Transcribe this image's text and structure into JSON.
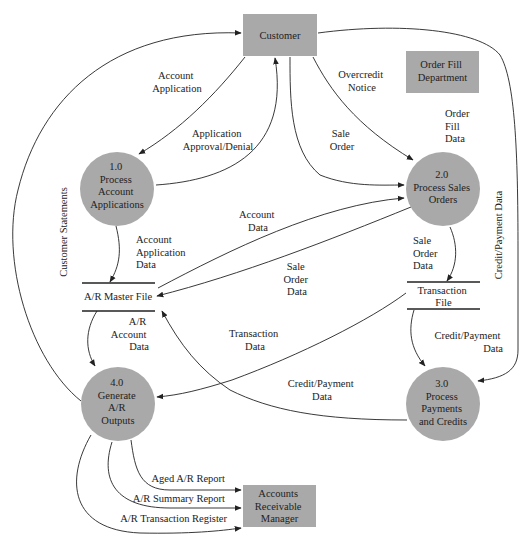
{
  "diagram": {
    "type": "data-flow-diagram",
    "colors": {
      "shape_fill": "#a9a9a9",
      "line": "#222222",
      "text": "#222222",
      "background": "#ffffff"
    },
    "external_entities": [
      {
        "id": "customer",
        "lines": [
          "Customer"
        ]
      },
      {
        "id": "order_fill",
        "lines": [
          "Order Fill",
          "Department"
        ]
      },
      {
        "id": "ar_manager",
        "lines": [
          "Accounts",
          "Receivable",
          "Manager"
        ]
      }
    ],
    "processes": [
      {
        "id": "p1",
        "lines": [
          "1.0",
          "Process",
          "Account",
          "Applications"
        ]
      },
      {
        "id": "p2",
        "lines": [
          "2.0",
          "Process Sales",
          "Orders"
        ]
      },
      {
        "id": "p3",
        "lines": [
          "3.0",
          "Process",
          "Payments",
          "and Credits"
        ]
      },
      {
        "id": "p4",
        "lines": [
          "4.0",
          "Generate",
          "A/R",
          "Outputs"
        ]
      }
    ],
    "data_stores": [
      {
        "id": "ar_master",
        "lines": [
          "A/R Master File"
        ]
      },
      {
        "id": "transaction",
        "lines": [
          "Transaction",
          "File"
        ]
      }
    ],
    "flows": [
      {
        "id": "account_application",
        "from": "Customer",
        "to": "1.0",
        "lines": [
          "Account",
          "Application"
        ]
      },
      {
        "id": "application_approval",
        "from": "1.0",
        "to": "Customer",
        "lines": [
          "Application",
          "Approval/Denial"
        ]
      },
      {
        "id": "overcredit_notice",
        "from": "2.0",
        "to": "Customer",
        "lines": [
          "Overcredit",
          "Notice"
        ]
      },
      {
        "id": "sale_order",
        "from": "Customer",
        "to": "2.0",
        "lines": [
          "Sale",
          "Order"
        ]
      },
      {
        "id": "order_fill_data",
        "from": "Order Fill Department",
        "to": "2.0",
        "lines": [
          "Order",
          "Fill",
          "Data"
        ]
      },
      {
        "id": "customer_statements",
        "from": "4.0",
        "to": "Customer",
        "lines": [
          "Customer Statements"
        ]
      },
      {
        "id": "credit_payment_data_customer",
        "from": "Customer",
        "to": "3.0",
        "lines": [
          "Credit/Payment Data"
        ]
      },
      {
        "id": "account_application_data",
        "from": "1.0",
        "to": "A/R Master File",
        "lines": [
          "Account",
          "Application",
          "Data"
        ]
      },
      {
        "id": "account_data",
        "from": "A/R Master File",
        "to": "2.0",
        "lines": [
          "Account",
          "Data"
        ]
      },
      {
        "id": "sale_order_data_ar",
        "from": "2.0",
        "to": "A/R Master File",
        "lines": [
          "Sale",
          "Order",
          "Data"
        ]
      },
      {
        "id": "sale_order_data_tf",
        "from": "2.0",
        "to": "Transaction File",
        "lines": [
          "Sale",
          "Order",
          "Data"
        ]
      },
      {
        "id": "ar_account_data",
        "from": "A/R Master File",
        "to": "4.0",
        "lines": [
          "A/R",
          "Account",
          "Data"
        ]
      },
      {
        "id": "transaction_data",
        "from": "Transaction File",
        "to": "4.0",
        "lines": [
          "Transaction",
          "Data"
        ]
      },
      {
        "id": "credit_payment_data_tf",
        "from": "Transaction File",
        "to": "3.0",
        "lines": [
          "Credit/Payment",
          "Data"
        ]
      },
      {
        "id": "credit_payment_data_ar",
        "from": "3.0",
        "to": "A/R Master File",
        "lines": [
          "Credit/Payment",
          "Data"
        ]
      },
      {
        "id": "aged_ar_report",
        "from": "4.0",
        "to": "Accounts Receivable Manager",
        "lines": [
          "Aged A/R Report"
        ]
      },
      {
        "id": "ar_summary_report",
        "from": "4.0",
        "to": "Accounts Receivable Manager",
        "lines": [
          "A/R Summary Report"
        ]
      },
      {
        "id": "ar_transaction_register",
        "from": "4.0",
        "to": "Accounts Receivable Manager",
        "lines": [
          "A/R Transaction Register"
        ]
      }
    ]
  }
}
